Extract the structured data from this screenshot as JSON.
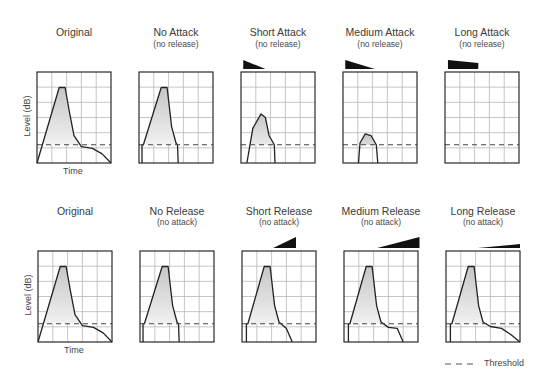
{
  "figure": {
    "rows": [
      {
        "name": "attack-row",
        "panels": [
          {
            "title": "Original",
            "subtitle": "",
            "curve": "original",
            "wedge": null,
            "y_label": "Level (dB)",
            "x_label": "Time"
          },
          {
            "title": "No Attack",
            "subtitle": "(no release)",
            "curve": "no_attack",
            "wedge": null
          },
          {
            "title": "Short Attack",
            "subtitle": "(no release)",
            "curve": "short_attack",
            "wedge": "short_attack"
          },
          {
            "title": "Medium Attack",
            "subtitle": "(no release)",
            "curve": "medium_attack",
            "wedge": "medium_attack"
          },
          {
            "title": "Long Attack",
            "subtitle": "(no release)",
            "curve": "long_attack",
            "wedge": "long_attack"
          }
        ]
      },
      {
        "name": "release-row",
        "panels": [
          {
            "title": "Original",
            "subtitle": "",
            "curve": "original",
            "wedge": null,
            "y_label": "Level (dB)",
            "x_label": "Time"
          },
          {
            "title": "No Release",
            "subtitle": "(no attack)",
            "curve": "no_release",
            "wedge": null
          },
          {
            "title": "Short Release",
            "subtitle": "(no attack)",
            "curve": "short_release",
            "wedge": "short_release"
          },
          {
            "title": "Medium Release",
            "subtitle": "(no attack)",
            "curve": "medium_release",
            "wedge": "medium_release"
          },
          {
            "title": "Long Release",
            "subtitle": "(no attack)",
            "curve": "long_release",
            "wedge": "long_release"
          }
        ]
      }
    ],
    "legend": {
      "threshold_label": "Threshold"
    },
    "labels": {
      "top_title_original": "Original",
      "top_title_1": "No Attack",
      "top_sub_1": "(no release)",
      "top_title_2": "Short Attack",
      "top_sub_2": "(no release)",
      "top_title_3": "Medium Attack",
      "top_sub_3": "(no release)",
      "top_title_4": "Long Attack",
      "top_sub_4": "(no release)",
      "bot_title_original": "Original",
      "bot_title_1": "No Release",
      "bot_sub_1": "(no attack)",
      "bot_title_2": "Short Release",
      "bot_sub_2": "(no attack)",
      "bot_title_3": "Medium Release",
      "bot_sub_3": "(no attack)",
      "bot_title_4": "Long Release",
      "bot_sub_4": "(no attack)",
      "y_axis": "Level (dB)",
      "x_axis": "Time"
    },
    "grid": {
      "cols": 5,
      "rows": 6,
      "threshold_level": 0.8
    },
    "colors": {
      "frame": "#2a2a2a",
      "grid": "#b8b8b8",
      "curve": "#222222",
      "fill_top": "#c8c8c8",
      "fill_bottom": "#ffffff",
      "threshold": "#444444",
      "wedge": "#111111"
    }
  },
  "chart_data": {
    "type": "line",
    "xlabel": "Time",
    "ylabel": "Level (dB)",
    "threshold": 0.8,
    "panels": {
      "original": [
        [
          0,
          1
        ],
        [
          0.3,
          0.17
        ],
        [
          0.38,
          0.17
        ],
        [
          0.44,
          0.45
        ],
        [
          0.5,
          0.7
        ],
        [
          0.6,
          0.82
        ],
        [
          0.75,
          0.84
        ],
        [
          0.88,
          0.9
        ],
        [
          1,
          1
        ]
      ],
      "no_attack": [
        [
          0.04,
          1
        ],
        [
          0.04,
          0.8
        ],
        [
          0.06,
          0.8
        ],
        [
          0.3,
          0.17
        ],
        [
          0.38,
          0.17
        ],
        [
          0.44,
          0.6
        ],
        [
          0.5,
          0.78
        ],
        [
          0.52,
          0.8
        ],
        [
          0.53,
          1
        ]
      ],
      "short_attack": [
        [
          0.08,
          1
        ],
        [
          0.16,
          0.62
        ],
        [
          0.27,
          0.46
        ],
        [
          0.33,
          0.5
        ],
        [
          0.38,
          0.7
        ],
        [
          0.45,
          0.8
        ],
        [
          0.46,
          1
        ]
      ],
      "medium_attack": [
        [
          0.21,
          1
        ],
        [
          0.23,
          0.78
        ],
        [
          0.3,
          0.68
        ],
        [
          0.38,
          0.7
        ],
        [
          0.45,
          0.8
        ],
        [
          0.47,
          1
        ]
      ],
      "long_attack": [],
      "no_release": [
        [
          0.04,
          1
        ],
        [
          0.04,
          0.8
        ],
        [
          0.06,
          0.8
        ],
        [
          0.3,
          0.17
        ],
        [
          0.38,
          0.17
        ],
        [
          0.44,
          0.6
        ],
        [
          0.5,
          0.78
        ],
        [
          0.52,
          0.8
        ],
        [
          0.53,
          1
        ]
      ],
      "short_release": [
        [
          0.06,
          1
        ],
        [
          0.06,
          0.8
        ],
        [
          0.08,
          0.8
        ],
        [
          0.3,
          0.17
        ],
        [
          0.38,
          0.17
        ],
        [
          0.44,
          0.6
        ],
        [
          0.5,
          0.78
        ],
        [
          0.6,
          0.85
        ],
        [
          0.68,
          1
        ]
      ],
      "medium_release": [
        [
          0.06,
          1
        ],
        [
          0.06,
          0.8
        ],
        [
          0.08,
          0.8
        ],
        [
          0.3,
          0.17
        ],
        [
          0.38,
          0.17
        ],
        [
          0.44,
          0.6
        ],
        [
          0.5,
          0.78
        ],
        [
          0.6,
          0.84
        ],
        [
          0.72,
          0.85
        ],
        [
          0.8,
          1
        ]
      ],
      "long_release": [
        [
          0.06,
          1
        ],
        [
          0.06,
          0.8
        ],
        [
          0.08,
          0.8
        ],
        [
          0.3,
          0.17
        ],
        [
          0.38,
          0.17
        ],
        [
          0.44,
          0.6
        ],
        [
          0.5,
          0.78
        ],
        [
          0.6,
          0.83
        ],
        [
          0.75,
          0.85
        ],
        [
          0.88,
          0.92
        ],
        [
          1,
          1
        ]
      ]
    },
    "wedges": {
      "short_attack": {
        "x0": 0.03,
        "x1": 0.33,
        "height": 9,
        "direction": "down"
      },
      "medium_attack": {
        "x0": 0.03,
        "x1": 0.43,
        "height": 9,
        "direction": "down"
      },
      "long_attack": {
        "x0": 0.04,
        "x1": 0.45,
        "height": 9,
        "direction": "flat"
      },
      "short_release": {
        "x0": 0.42,
        "x1": 0.73,
        "height": 11,
        "direction": "up"
      },
      "medium_release": {
        "x0": 0.45,
        "x1": 1.02,
        "height": 11,
        "direction": "up"
      },
      "long_release": {
        "x0": 0.43,
        "x1": 1.0,
        "height": 4,
        "direction": "up"
      }
    },
    "legend": [
      {
        "label": "Threshold",
        "style": "dashed"
      }
    ]
  }
}
